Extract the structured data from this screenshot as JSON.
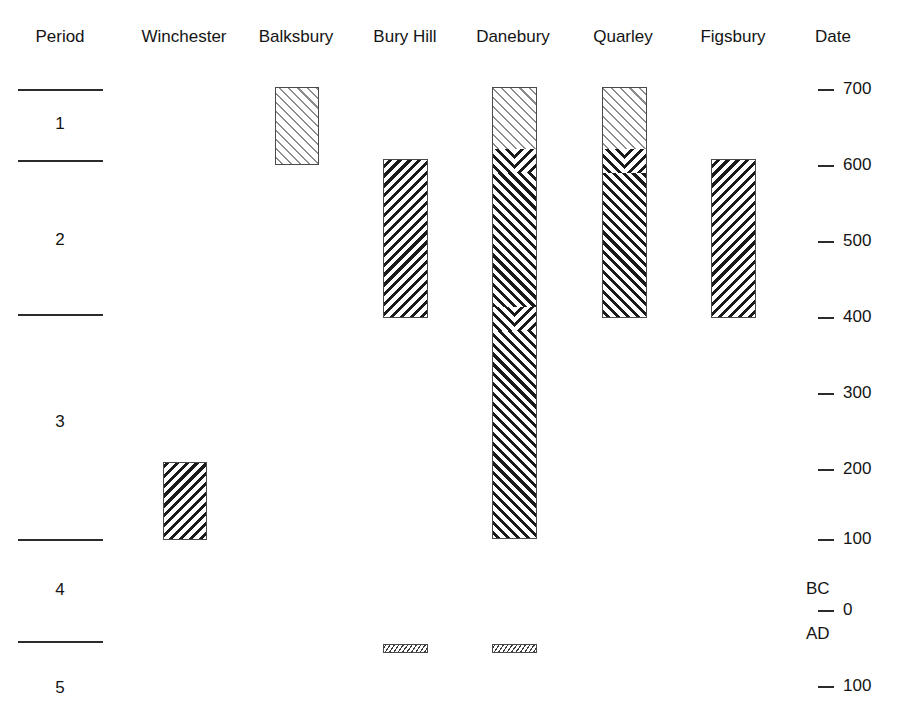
{
  "chart_data": {
    "type": "bar",
    "orientation": "vertical-timeline",
    "title": "",
    "xlabel": "",
    "ylabel": "Date",
    "grid": false,
    "legend": false,
    "axis": {
      "label": "Date",
      "ylim": [
        700,
        -100
      ],
      "ticks": [
        {
          "value": 700,
          "label": "700",
          "era": "BC",
          "y": 89
        },
        {
          "value": 600,
          "label": "600",
          "era": "BC",
          "y": 165
        },
        {
          "value": 500,
          "label": "500",
          "era": "BC",
          "y": 241
        },
        {
          "value": 400,
          "label": "400",
          "era": "BC",
          "y": 317
        },
        {
          "value": 300,
          "label": "300",
          "era": "BC",
          "y": 393
        },
        {
          "value": 200,
          "label": "200",
          "era": "BC",
          "y": 469
        },
        {
          "value": 100,
          "label": "100",
          "era": "BC",
          "y": 539
        },
        {
          "value": 0,
          "label": "0",
          "era": "",
          "y": 610
        },
        {
          "value": -100,
          "label": "100",
          "era": "AD",
          "y": 686
        }
      ],
      "era_markers": [
        {
          "label": "BC",
          "y": 589
        },
        {
          "label": "AD",
          "y": 634
        }
      ]
    },
    "columns": [
      {
        "key": "period",
        "label": "Period",
        "x": 60
      },
      {
        "key": "winchester",
        "label": "Winchester",
        "x": 184
      },
      {
        "key": "balksbury",
        "label": "Balksbury",
        "x": 296
      },
      {
        "key": "buryhill",
        "label": "Bury Hill",
        "x": 405
      },
      {
        "key": "danebury",
        "label": "Danebury",
        "x": 513
      },
      {
        "key": "quarley",
        "label": "Quarley",
        "x": 623
      },
      {
        "key": "figsbury",
        "label": "Figsbury",
        "x": 733
      },
      {
        "key": "date",
        "label": "Date",
        "x": 833
      }
    ],
    "periods": [
      {
        "label": "1",
        "top": 89,
        "bottom": 160,
        "label_y": 124
      },
      {
        "label": "2",
        "top": 160,
        "bottom": 314,
        "label_y": 240
      },
      {
        "label": "3",
        "top": 314,
        "bottom": 539,
        "label_y": 422
      },
      {
        "label": "4",
        "top": 539,
        "bottom": 641,
        "label_y": 590
      },
      {
        "label": "5",
        "top": 641,
        "bottom": 717,
        "label_y": 688
      }
    ],
    "period_rules_y": [
      89,
      160,
      314,
      539,
      641
    ],
    "bars": [
      {
        "site": "Winchester",
        "x": 163,
        "width": 44,
        "top": 462,
        "bottom": 540,
        "start_date": 200,
        "end_date": 100,
        "segments": [
          {
            "style": "dark-backslash",
            "top": 462,
            "bottom": 540
          }
        ]
      },
      {
        "site": "Balksbury",
        "x": 275,
        "width": 44,
        "top": 87,
        "bottom": 165,
        "start_date": 700,
        "end_date": 600,
        "segments": [
          {
            "style": "light-forwardslash",
            "top": 87,
            "bottom": 165
          }
        ]
      },
      {
        "site": "Bury Hill",
        "x": 383,
        "width": 45,
        "top": 159,
        "bottom": 318,
        "start_date": 600,
        "end_date": 400,
        "segments": [
          {
            "style": "dark-backslash",
            "top": 159,
            "bottom": 318
          }
        ]
      },
      {
        "site": "Danebury",
        "x": 492,
        "width": 45,
        "top": 87,
        "bottom": 539,
        "start_date": 700,
        "end_date": 100,
        "segments": [
          {
            "style": "light-forwardslash",
            "top": 87,
            "bottom": 160
          },
          {
            "style": "dark-forwardslash",
            "top": 160,
            "bottom": 539
          }
        ],
        "chevrons_y": [
          160,
          318
        ]
      },
      {
        "site": "Quarley",
        "x": 602,
        "width": 45,
        "top": 87,
        "bottom": 318,
        "start_date": 700,
        "end_date": 400,
        "segments": [
          {
            "style": "light-forwardslash",
            "top": 87,
            "bottom": 160
          },
          {
            "style": "dark-forwardslash",
            "top": 160,
            "bottom": 318
          }
        ],
        "chevrons_y": [
          160
        ]
      },
      {
        "site": "Figsbury",
        "x": 711,
        "width": 45,
        "top": 159,
        "bottom": 318,
        "start_date": 600,
        "end_date": 400,
        "segments": [
          {
            "style": "dark-backslash",
            "top": 159,
            "bottom": 318
          }
        ]
      },
      {
        "site": "Bury Hill (late)",
        "x": 383,
        "width": 45,
        "top": 644,
        "bottom": 653,
        "start_date": -50,
        "end_date": -70,
        "segments": [
          {
            "style": "fine-backslash",
            "top": 644,
            "bottom": 653
          }
        ]
      },
      {
        "site": "Danebury (late)",
        "x": 492,
        "width": 45,
        "top": 644,
        "bottom": 653,
        "start_date": -50,
        "end_date": -70,
        "segments": [
          {
            "style": "fine-backslash",
            "top": 644,
            "bottom": 653
          }
        ]
      }
    ]
  },
  "colors": {
    "background": "#ffffff",
    "ink": "#1a1a1a",
    "rule": "#2b2b2b",
    "hatch_light": "#8c8c8c",
    "hatch_dark": "#1a1a1a",
    "bar_outline": "#4a4a4a"
  }
}
